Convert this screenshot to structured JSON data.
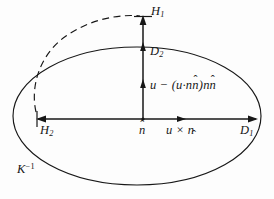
{
  "figure": {
    "background_color": "#fdfdfd",
    "stroke_color": "#171717",
    "labels": {
      "h1": "H",
      "h1_sub": "1",
      "d2": "D",
      "d2_sub": "2",
      "h2": "H",
      "h2_sub": "2",
      "d1": "D",
      "d1_sub": "1",
      "n_hat": "n",
      "hat_mark": "ˆ",
      "u_cross_n": "u × n",
      "projection": "u − (u·n",
      "projection_mid": ")n",
      "k_inverse": "K",
      "k_inverse_sup": "−1"
    },
    "geometry": {
      "ellipse_center_x": 137,
      "ellipse_center_y": 116,
      "ellipse_rx": 125,
      "ellipse_ry": 70,
      "vertical_axis_x": 143,
      "horizontal_axis_y": 119,
      "h1_arrow_tip_y": 17,
      "d2_arrow_tip_y": 45,
      "mid_arrow_tip_y": 83,
      "h2_arrow_tip_x": 37,
      "d1_arrow_tip_x": 257,
      "uxn_arrow_tip_x": 182,
      "dashed_arc_style": "dashed"
    },
    "elements": [
      "solid-ellipse",
      "dashed-arc",
      "vertical-arrow",
      "horizontal-arrow",
      "intermediate-arrowheads"
    ]
  }
}
